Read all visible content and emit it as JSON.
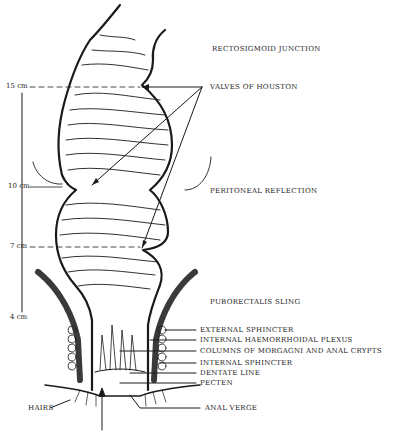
{
  "diagram": {
    "scale_marks": [
      {
        "label": "15 cm",
        "y": 87
      },
      {
        "label": "10 cm",
        "y": 187
      },
      {
        "label": "7 cm",
        "y": 247
      },
      {
        "label": "4 cm",
        "y": 318
      }
    ],
    "labels": {
      "rectosigmoid_junction": "RECTOSIGMOID JUNCTION",
      "valves_of_houston": "VALVES OF HOUSTON",
      "peritoneal_reflection": "PERITONEAL REFLECTION",
      "puborectalis_sling": "PUBORECTALIS SLING",
      "external_sphincter": "EXTERNAL SPHINCTER",
      "internal_haemorrhoidal_plexus": "INTERNAL HAEMORRHOIDAL PLEXUS",
      "columns_of_morgagni": "COLUMNS OF MORGAGNI AND ANAL CRYPTS",
      "internal_sphincter": "INTERNAL SPHINCTER",
      "dentate_line": "DENTATE LINE",
      "pecten": "PECTEN",
      "hairs": "HAIRS",
      "anal_verge": "ANAL VERGE"
    },
    "colors": {
      "ink": "#1a1a1a",
      "background": "#ffffff"
    }
  }
}
